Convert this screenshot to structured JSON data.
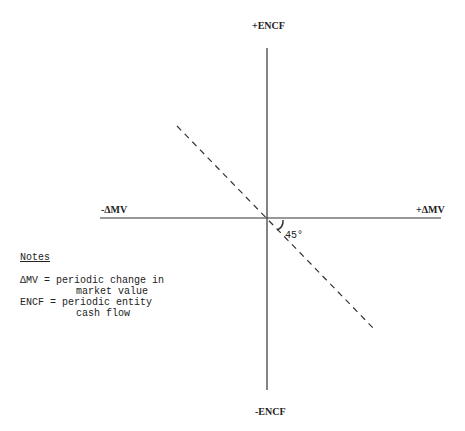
{
  "diagram": {
    "axes": {
      "y_positive": "+ENCF",
      "y_negative": "-ENCF",
      "x_negative": "-ΔMV",
      "x_positive": "+ΔMV"
    },
    "angle_label": "45°",
    "line_style": "dashed",
    "line_description": "Dashed line through origin from upper-left quadrant to lower-right quadrant at 45°"
  },
  "notes": {
    "title": "Notes",
    "items": [
      {
        "term": "ΔMV",
        "sep": " = ",
        "line1": "periodic change in",
        "line2": "market value"
      },
      {
        "term": "ENCF",
        "sep": " = ",
        "line1": "periodic entity",
        "line2": "cash flow"
      }
    ]
  }
}
